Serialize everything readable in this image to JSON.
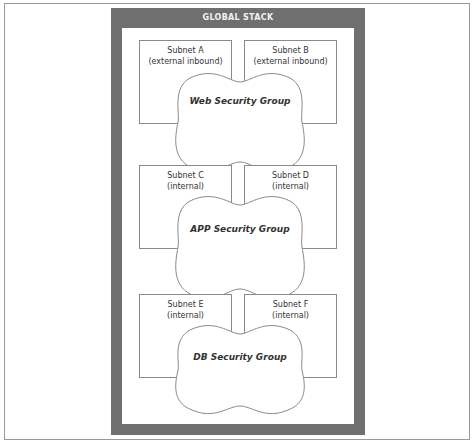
{
  "diagram": {
    "stack_title": "GLOBAL STACK",
    "tiers": [
      {
        "security_group": "Web Security Group",
        "subnets": [
          {
            "name": "Subnet A",
            "type": "(external inbound)"
          },
          {
            "name": "Subnet B",
            "type": "(external inbound)"
          }
        ]
      },
      {
        "security_group": "APP Security Group",
        "subnets": [
          {
            "name": "Subnet C",
            "type": "(internal)"
          },
          {
            "name": "Subnet D",
            "type": "(internal)"
          }
        ]
      },
      {
        "security_group": "DB Security Group",
        "subnets": [
          {
            "name": "Subnet E",
            "type": "(internal)"
          },
          {
            "name": "Subnet F",
            "type": "(internal)"
          }
        ]
      }
    ],
    "colors": {
      "stack_fill": "#6f6f6f",
      "stack_title_text": "#f2f2f2",
      "line": "#8a8a8a"
    }
  }
}
